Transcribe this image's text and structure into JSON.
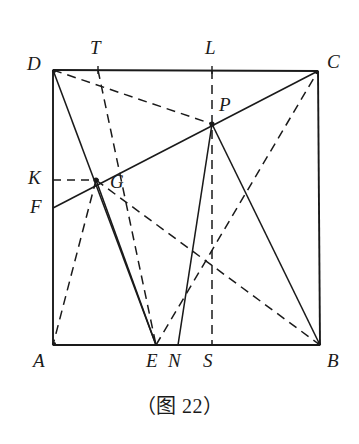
{
  "figure": {
    "caption": "（图 22）",
    "stroke_color": "#1a1a1a",
    "background_color": "#ffffff",
    "square": {
      "name": "ABCD",
      "corners": {
        "A": [
          53,
          345
        ],
        "B": [
          320,
          345
        ],
        "C": [
          318,
          71
        ],
        "D": [
          53,
          70
        ]
      }
    },
    "points": {
      "A": {
        "label": "A",
        "x": 53,
        "y": 345
      },
      "B": {
        "label": "B",
        "x": 320,
        "y": 345
      },
      "C": {
        "label": "C",
        "x": 318,
        "y": 71
      },
      "D": {
        "label": "D",
        "x": 53,
        "y": 70
      },
      "T": {
        "label": "T",
        "x": 98,
        "y": 70
      },
      "L": {
        "label": "L",
        "x": 212,
        "y": 70
      },
      "P": {
        "label": "P",
        "x": 212,
        "y": 124
      },
      "G": {
        "label": "G",
        "x": 96,
        "y": 180
      },
      "K": {
        "label": "K",
        "x": 53,
        "y": 180
      },
      "F": {
        "label": "F",
        "x": 53,
        "y": 208
      },
      "E": {
        "label": "E",
        "x": 156,
        "y": 345
      },
      "N": {
        "label": "N",
        "x": 178,
        "y": 345
      },
      "S": {
        "label": "S",
        "x": 212,
        "y": 345
      }
    },
    "labels": [
      {
        "name": "point-label-D",
        "text": "D",
        "left": 27,
        "top": 54
      },
      {
        "name": "point-label-T",
        "text": "T",
        "left": 90,
        "top": 38
      },
      {
        "name": "point-label-L",
        "text": "L",
        "left": 205,
        "top": 38
      },
      {
        "name": "point-label-C",
        "text": "C",
        "left": 327,
        "top": 52
      },
      {
        "name": "point-label-P",
        "text": "P",
        "left": 219,
        "top": 95
      },
      {
        "name": "point-label-K",
        "text": "K",
        "left": 28,
        "top": 168
      },
      {
        "name": "point-label-G",
        "text": "G",
        "left": 110,
        "top": 172
      },
      {
        "name": "point-label-F",
        "text": "F",
        "left": 30,
        "top": 197
      },
      {
        "name": "point-label-A",
        "text": "A",
        "left": 33,
        "top": 351
      },
      {
        "name": "point-label-E",
        "text": "E",
        "left": 146,
        "top": 351
      },
      {
        "name": "point-label-N",
        "text": "N",
        "left": 168,
        "top": 351
      },
      {
        "name": "point-label-S",
        "text": "S",
        "left": 203,
        "top": 351
      },
      {
        "name": "point-label-B",
        "text": "B",
        "left": 327,
        "top": 351
      }
    ],
    "segments_solid": [
      {
        "name": "side-DA",
        "from": "D",
        "to": "A"
      },
      {
        "name": "side-AB",
        "from": "A",
        "to": "B"
      },
      {
        "name": "side-BC",
        "from": "B",
        "to": "C"
      },
      {
        "name": "side-CD",
        "from": "C",
        "to": "D"
      },
      {
        "name": "segment-D-to-E",
        "from": "D",
        "to": "E"
      },
      {
        "name": "segment-F-to-C-through-G-P",
        "from": "F",
        "to": "C"
      },
      {
        "name": "segment-G-to-E",
        "from": "G",
        "to": "E"
      },
      {
        "name": "segment-P-to-N",
        "from": "P",
        "to": "N"
      },
      {
        "name": "segment-P-to-B",
        "from": "P",
        "to": "B"
      }
    ],
    "segments_dashed": [
      {
        "name": "segment-D-to-P",
        "from": "D",
        "to": "P"
      },
      {
        "name": "segment-T-to-E",
        "from": "T",
        "to": "E"
      },
      {
        "name": "segment-L-to-S",
        "from": "L",
        "to": "S"
      },
      {
        "name": "segment-K-to-G",
        "from": "K",
        "to": "G"
      },
      {
        "name": "segment-G-to-A",
        "from": "G",
        "to": "A"
      },
      {
        "name": "segment-G-to-B",
        "from": "G",
        "to": "B"
      },
      {
        "name": "segment-E-to-C",
        "from": "E",
        "to": "C"
      }
    ],
    "marked_points": [
      "G",
      "P",
      "A",
      "B",
      "C",
      "D"
    ]
  }
}
